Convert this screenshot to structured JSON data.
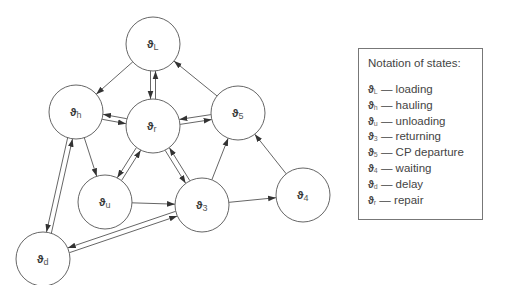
{
  "diagram": {
    "nodes": [
      {
        "id": "L",
        "symbol": "ϑ",
        "sub": "L",
        "cx": 153,
        "cy": 44,
        "r": 27
      },
      {
        "id": "h",
        "symbol": "ϑ",
        "sub": "h",
        "cx": 76,
        "cy": 112,
        "r": 27
      },
      {
        "id": "r",
        "symbol": "ϑ",
        "sub": "r",
        "cx": 153,
        "cy": 126,
        "r": 27
      },
      {
        "id": "5",
        "symbol": "ϑ",
        "sub": "5",
        "cx": 238,
        "cy": 113,
        "r": 27
      },
      {
        "id": "u",
        "symbol": "ϑ",
        "sub": "u",
        "cx": 105,
        "cy": 202,
        "r": 27
      },
      {
        "id": "3",
        "symbol": "ϑ",
        "sub": "3",
        "cx": 202,
        "cy": 205,
        "r": 27
      },
      {
        "id": "4",
        "symbol": "ϑ",
        "sub": "4",
        "cx": 303,
        "cy": 195,
        "r": 27
      },
      {
        "id": "d",
        "symbol": "ϑ",
        "sub": "d",
        "cx": 43,
        "cy": 259,
        "r": 27
      }
    ],
    "edges": [
      {
        "from": "L",
        "to": "h",
        "bidirectional": false
      },
      {
        "from": "L",
        "to": "r",
        "bidirectional": true
      },
      {
        "from": "5",
        "to": "L",
        "bidirectional": false
      },
      {
        "from": "h",
        "to": "r",
        "bidirectional": true
      },
      {
        "from": "h",
        "to": "u",
        "bidirectional": false
      },
      {
        "from": "h",
        "to": "d",
        "bidirectional": true
      },
      {
        "from": "r",
        "to": "u",
        "bidirectional": true
      },
      {
        "from": "r",
        "to": "3",
        "bidirectional": true
      },
      {
        "from": "r",
        "to": "5",
        "bidirectional": true
      },
      {
        "from": "u",
        "to": "3",
        "bidirectional": false
      },
      {
        "from": "3",
        "to": "5",
        "bidirectional": false
      },
      {
        "from": "3",
        "to": "4",
        "bidirectional": false
      },
      {
        "from": "4",
        "to": "5",
        "bidirectional": false
      },
      {
        "from": "3",
        "to": "d",
        "bidirectional": true
      }
    ],
    "stroke_color": "#666666",
    "arrow_color": "#333333"
  },
  "legend": {
    "title": "Notation of states:",
    "dash": " — ",
    "items": [
      {
        "symbol": "ϑ",
        "sub": "L",
        "label": "loading"
      },
      {
        "symbol": "ϑ",
        "sub": "h",
        "label": "hauling"
      },
      {
        "symbol": "ϑ",
        "sub": "u",
        "label": "unloading"
      },
      {
        "symbol": "ϑ",
        "sub": "3",
        "label": "returning"
      },
      {
        "symbol": "ϑ",
        "sub": "5",
        "label": "CP departure"
      },
      {
        "symbol": "ϑ",
        "sub": "4",
        "label": "waiting"
      },
      {
        "symbol": "ϑ",
        "sub": "d",
        "label": "delay"
      },
      {
        "symbol": "ϑ",
        "sub": "r",
        "label": "repair"
      }
    ]
  }
}
